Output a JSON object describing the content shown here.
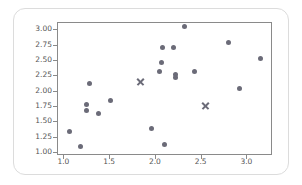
{
  "chart_data": {
    "type": "scatter",
    "title": "",
    "xlabel": "",
    "ylabel": "",
    "xlim": [
      0.93,
      3.28
    ],
    "ylim": [
      0.95,
      3.12
    ],
    "grid": false,
    "legend": null,
    "xticks": [
      "1.0",
      "1.5",
      "2.0",
      "2.5",
      "3.0"
    ],
    "xtick_values": [
      1.0,
      1.5,
      2.0,
      2.5,
      3.0
    ],
    "yticks": [
      "1.00",
      "1.25",
      "1.50",
      "1.75",
      "2.00",
      "2.25",
      "2.50",
      "2.75",
      "3.00"
    ],
    "ytick_values": [
      1.0,
      1.25,
      1.5,
      1.75,
      2.0,
      2.25,
      2.5,
      2.75,
      3.0
    ],
    "marker_color": "#6b6b78",
    "frame_color": "#8a8a8a",
    "series": [
      {
        "name": "data-points",
        "marker": "circle",
        "color": "#6b6b78",
        "points": [
          [
            1.07,
            1.33
          ],
          [
            1.19,
            1.09
          ],
          [
            1.25,
            1.78
          ],
          [
            1.25,
            1.68
          ],
          [
            1.29,
            2.12
          ],
          [
            1.38,
            1.63
          ],
          [
            1.52,
            1.84
          ],
          [
            1.96,
            1.38
          ],
          [
            2.05,
            2.32
          ],
          [
            2.07,
            2.46
          ],
          [
            2.08,
            2.71
          ],
          [
            2.1,
            1.12
          ],
          [
            2.2,
            2.71
          ],
          [
            2.22,
            2.26
          ],
          [
            2.23,
            2.22
          ],
          [
            2.32,
            3.05
          ],
          [
            2.43,
            2.32
          ],
          [
            2.8,
            2.78
          ],
          [
            2.92,
            2.04
          ],
          [
            3.15,
            2.52
          ]
        ]
      },
      {
        "name": "x-markers",
        "marker": "x",
        "color": "#6b6b78",
        "points": [
          [
            1.84,
            2.14
          ],
          [
            2.55,
            1.76
          ]
        ]
      }
    ]
  }
}
